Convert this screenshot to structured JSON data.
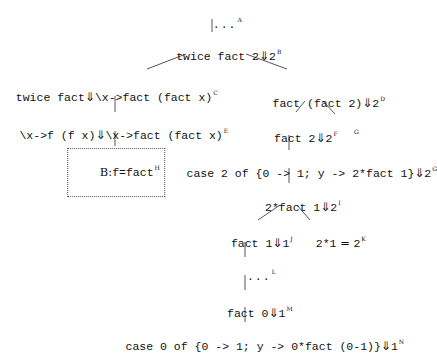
{
  "diagram": {
    "type": "derivation-tree",
    "arrow_symbol": "⇓",
    "nodes": {
      "A": {
        "expr": "...",
        "value": "",
        "label": "A"
      },
      "B": {
        "expr": "twice fact 2",
        "value": "2",
        "label": "B"
      },
      "C": {
        "expr": "twice fact",
        "value": "\\x->fact (fact x)",
        "label": "C"
      },
      "D": {
        "expr": "fact (fact 2)",
        "value": "2",
        "label": "D"
      },
      "E": {
        "expr": "\\x->f (f x)",
        "value": "\\x->fact (fact x)",
        "label": "E"
      },
      "F": {
        "expr": "fact 2",
        "value": "2",
        "label": "F"
      },
      "G_leaf": {
        "expr": "",
        "value": "",
        "label": "G"
      },
      "G": {
        "expr": "case 2 of {0 -> 1; y -> 2*fact 1}",
        "value": "2",
        "label": "G"
      },
      "H": {
        "binding_label": "B:",
        "expr": "f=fact",
        "label": "H"
      },
      "I": {
        "expr": "2*fact 1",
        "value": "2",
        "label": "I"
      },
      "J": {
        "expr": "fact 1",
        "value": "1",
        "label": "J"
      },
      "K": {
        "expr": "2*1",
        "eq": "=",
        "value": "2",
        "label": "K"
      },
      "L": {
        "expr": "...",
        "value": "",
        "label": "L"
      },
      "M": {
        "expr": "fact 0",
        "value": "1",
        "label": "M"
      },
      "N": {
        "expr": "case 0 of {0 -> 1; y -> 0*fact (0-1)}",
        "value": "1",
        "label": "N"
      }
    },
    "edges": [
      [
        "A",
        "B"
      ],
      [
        "B",
        "C"
      ],
      [
        "B",
        "D"
      ],
      [
        "C",
        "E"
      ],
      [
        "E",
        "H"
      ],
      [
        "D",
        "F"
      ],
      [
        "D",
        "G_leaf"
      ],
      [
        "F",
        "G"
      ],
      [
        "G",
        "I"
      ],
      [
        "I",
        "J"
      ],
      [
        "I",
        "K"
      ],
      [
        "J",
        "L"
      ],
      [
        "L",
        "M"
      ],
      [
        "M",
        "N"
      ]
    ]
  }
}
